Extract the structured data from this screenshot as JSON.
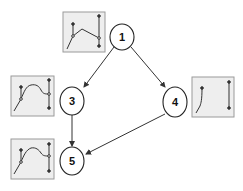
{
  "diagram": {
    "type": "directed-graph",
    "colors": {
      "background": "#ffffff",
      "node_fill": "#ffffff",
      "node_stroke": "#222222",
      "edge": "#333333",
      "thumb_fill": "#eeeeee",
      "thumb_stroke": "#9a9a9a",
      "curve": "#333333"
    },
    "nodes": [
      {
        "id": "1",
        "label": "1",
        "cx": 122,
        "cy": 37,
        "rx": 12,
        "ry": 13
      },
      {
        "id": "3",
        "label": "3",
        "cx": 72,
        "cy": 101,
        "rx": 12,
        "ry": 14
      },
      {
        "id": "4",
        "label": "4",
        "cx": 175,
        "cy": 102,
        "rx": 12,
        "ry": 15
      },
      {
        "id": "5",
        "label": "5",
        "cx": 72,
        "cy": 161,
        "rx": 12,
        "ry": 14
      }
    ],
    "edges": [
      {
        "from": "1",
        "to": "3"
      },
      {
        "from": "1",
        "to": "4"
      },
      {
        "from": "3",
        "to": "5"
      },
      {
        "from": "4",
        "to": "5"
      }
    ],
    "thumbnails": [
      {
        "node": "1",
        "icon": "curve-thumbnail-icon"
      },
      {
        "node": "3",
        "icon": "curve-thumbnail-icon"
      },
      {
        "node": "4",
        "icon": "curve-thumbnail-icon"
      },
      {
        "node": "5",
        "icon": "curve-thumbnail-icon"
      }
    ]
  }
}
